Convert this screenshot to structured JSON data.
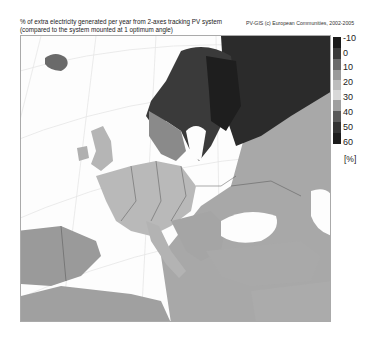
{
  "title": {
    "line1": "% of extra electricity generated per year from 2-axes tracking PV system",
    "line2": "(compared to the system mounted at 1 optimum angle)"
  },
  "credit": "PV-GIS (c) European Communities, 2002-2005",
  "legend": {
    "unit": "[%]",
    "ticks": [
      "-10",
      "0",
      "10",
      "20",
      "30",
      "40",
      "50",
      "60"
    ],
    "colors": [
      "#1a1a1a",
      "#3a3a3a",
      "#6a6a6a",
      "#9a9a9a",
      "#bdbdbd",
      "#d8d8d8",
      "#a0a0a0",
      "#5a5a5a",
      "#333333",
      "#1c1c1c"
    ]
  },
  "map": {
    "region": "Europe",
    "projection": "conic, graticule shown",
    "sea_color": "#fdfdfd",
    "land_base_color": "#b8b8b8",
    "north_color": "#2e2e2e"
  }
}
